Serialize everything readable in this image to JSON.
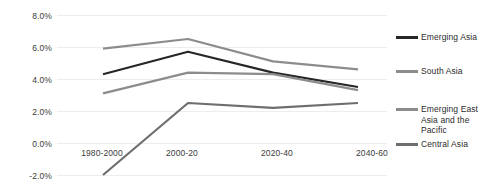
{
  "chart_data": {
    "type": "line",
    "title": "",
    "xlabel": "",
    "ylabel": "",
    "categories": [
      "1980-2000",
      "2000-20",
      "2020-40",
      "2040-60"
    ],
    "ylim": [
      -2.0,
      8.0
    ],
    "ytick_labels": [
      "8.0%",
      "6.0%",
      "4.0%",
      "2.0%",
      "0.0%",
      "-2.0%"
    ],
    "ytick_values": [
      8.0,
      6.0,
      4.0,
      2.0,
      0.0,
      -2.0
    ],
    "grid": true,
    "legend_position": "right",
    "series": [
      {
        "name": "Emerging Asia",
        "color": "#262626",
        "values": [
          4.3,
          5.7,
          4.4,
          3.5
        ]
      },
      {
        "name": "South Asia",
        "color": "#8c8c8c",
        "values": [
          5.9,
          6.5,
          5.1,
          4.6
        ]
      },
      {
        "name": "Emerging East Asia and the Pacific",
        "color": "#8c8c8c",
        "values": [
          3.1,
          4.4,
          4.3,
          3.3
        ]
      },
      {
        "name": "Central Asia",
        "color": "#6e6e6e",
        "values": [
          -2.0,
          2.5,
          2.2,
          2.5
        ]
      }
    ]
  },
  "legend": {
    "items": [
      {
        "label": "Emerging Asia",
        "color": "#262626"
      },
      {
        "label": "South Asia",
        "color": "#8c8c8c"
      },
      {
        "label": "Emerging East Asia and the Pacific",
        "color": "#8c8c8c"
      },
      {
        "label": "Central Asia",
        "color": "#6e6e6e"
      }
    ]
  },
  "axis": {
    "y_labels": [
      "8.0%",
      "6.0%",
      "4.0%",
      "2.0%",
      "0.0%",
      "-2.0%"
    ],
    "x_labels": [
      "1980-2000",
      "2000-20",
      "2020-40",
      "2040-60"
    ]
  }
}
